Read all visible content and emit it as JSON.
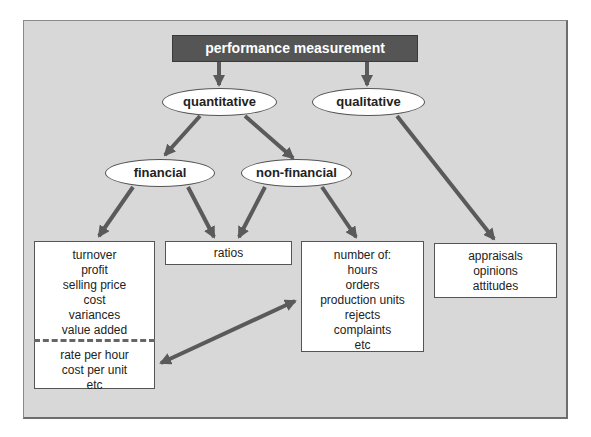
{
  "diagram": {
    "title": "performance measurement",
    "colors": {
      "background": "#d8d8d8",
      "title_fill": "#555555",
      "title_text": "#ffffff",
      "arrow": "#5a5a5a",
      "node_fill": "#ffffff"
    },
    "level1": {
      "quantitative": "quantitative",
      "qualitative": "qualitative"
    },
    "level2": {
      "financial": "financial",
      "non_financial": "non-financial"
    },
    "boxes": {
      "financial_measures": {
        "items": [
          "turnover",
          "profit",
          "selling price",
          "cost",
          "variances",
          "value added"
        ],
        "below_divider": [
          "rate per hour",
          "cost per unit",
          "etc"
        ]
      },
      "ratios": {
        "label": "ratios"
      },
      "non_financial_measures": {
        "items": [
          "number of:",
          "hours",
          "orders",
          "production units",
          "rejects",
          "complaints",
          "etc"
        ]
      },
      "qualitative_measures": {
        "items": [
          "appraisals",
          "opinions",
          "attitudes"
        ]
      }
    },
    "edges": [
      {
        "from": "performance measurement",
        "to": "quantitative"
      },
      {
        "from": "performance measurement",
        "to": "qualitative"
      },
      {
        "from": "quantitative",
        "to": "financial"
      },
      {
        "from": "quantitative",
        "to": "non-financial"
      },
      {
        "from": "financial",
        "to": "financial measures box"
      },
      {
        "from": "financial",
        "to": "ratios"
      },
      {
        "from": "non-financial",
        "to": "ratios"
      },
      {
        "from": "non-financial",
        "to": "non-financial measures box"
      },
      {
        "from": "qualitative",
        "to": "qualitative measures box"
      },
      {
        "from": "rate per hour / cost per unit",
        "to": "non-financial measures box",
        "bidirectional": true
      }
    ]
  }
}
